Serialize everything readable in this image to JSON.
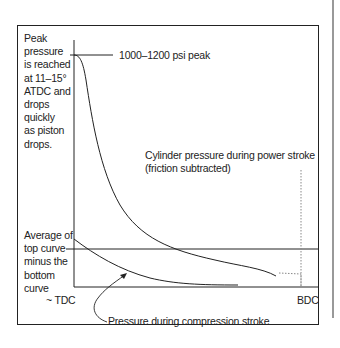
{
  "diagram": {
    "annotations": {
      "peak_note": [
        "Peak",
        "pressure",
        "is reached",
        "at 11–15°",
        "ATDC and",
        "drops",
        "quickly",
        "as piston",
        "drops."
      ],
      "peak_value": "1000–1200 psi peak",
      "power_curve": [
        "Cylinder pressure during power stroke",
        "(friction subtracted)"
      ],
      "average_note": [
        "Average of",
        "top curve",
        "minus the",
        "bottom",
        "curve"
      ],
      "compression_curve": "Pressure during compression stroke"
    },
    "axis": {
      "x_start": "~ TDC",
      "x_end": "BDC"
    },
    "colors": {
      "line": "#222222",
      "frame": "#222222",
      "dotted": "#888888",
      "side_rule": "#999999"
    }
  }
}
